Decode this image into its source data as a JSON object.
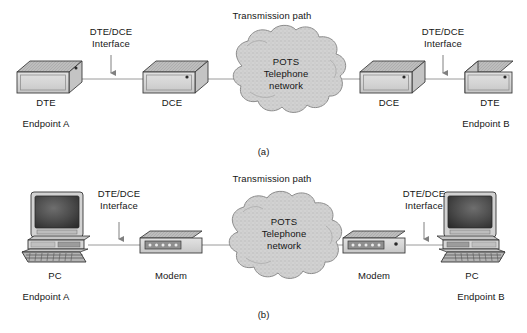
{
  "figure": {
    "title_top": "Transmission path",
    "title_bottom": "Transmission path",
    "caption_a": "(a)",
    "caption_b": "(b)"
  },
  "colors": {
    "background": "#ffffff",
    "text": "#161616",
    "line": "#8a8a8a",
    "box_face": "#d6d6d6",
    "box_top": "#b9b9b9",
    "box_side": "#c9c9c9",
    "box_outline": "#3a3a3a",
    "cloud_fill": "#cfcfcf",
    "cloud_outline": "#7d7d7d",
    "screen": "#3c3c3c",
    "arrow": "#707070"
  },
  "panel_a": {
    "name": "panel-a",
    "cloud": {
      "line1": "POTS",
      "line2": "Telephone",
      "line3": "network"
    },
    "transmission_path_label": "Transmission path",
    "interface_left": {
      "line1": "DTE/DCE",
      "line2": "Interface"
    },
    "interface_right": {
      "line1": "DTE/DCE",
      "line2": "Interface"
    },
    "nodes": [
      {
        "id": "dte-left",
        "label": "DTE",
        "sublabel": "Endpoint A"
      },
      {
        "id": "dce-left",
        "label": "DCE",
        "sublabel": ""
      },
      {
        "id": "dce-right",
        "label": "DCE",
        "sublabel": ""
      },
      {
        "id": "dte-right",
        "label": "DTE",
        "sublabel": "Endpoint B"
      }
    ],
    "caption": "(a)"
  },
  "panel_b": {
    "name": "panel-b",
    "cloud": {
      "line1": "POTS",
      "line2": "Telephone",
      "line3": "network"
    },
    "transmission_path_label": "Transmission path",
    "interface_left": {
      "line1": "DTE/DCE",
      "line2": "Interface"
    },
    "interface_right": {
      "line1": "DTE/DCE",
      "line2": "Interface"
    },
    "nodes": [
      {
        "id": "pc-left",
        "label": "PC",
        "sublabel": "Endpoint A"
      },
      {
        "id": "modem-left",
        "label": "Modem",
        "sublabel": ""
      },
      {
        "id": "modem-right",
        "label": "Modem",
        "sublabel": ""
      },
      {
        "id": "pc-right",
        "label": "PC",
        "sublabel": "Endpoint B"
      }
    ],
    "caption": "(b)"
  }
}
